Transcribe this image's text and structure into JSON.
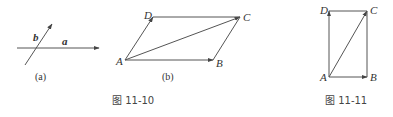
{
  "figure_11_10": {
    "caption": "图 11-10",
    "subfigure_a": {
      "label": "(a)",
      "vectors": [
        {
          "name": "a",
          "label": "a"
        },
        {
          "name": "b",
          "label": "b"
        }
      ]
    },
    "subfigure_b": {
      "label": "(b)",
      "points": {
        "A": "A",
        "B": "B",
        "C": "C",
        "D": "D"
      }
    }
  },
  "figure_11_11": {
    "caption": "图 11-11",
    "points": {
      "A": "A",
      "B": "B",
      "C": "C",
      "D": "D"
    }
  },
  "colors": {
    "line": "#555555",
    "text": "#333333",
    "background": "#ffffff"
  }
}
